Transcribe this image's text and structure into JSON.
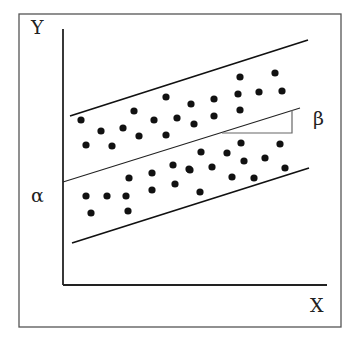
{
  "diagram": {
    "title": "",
    "labels": {
      "y_axis": "Y",
      "x_axis": "X",
      "intercept": "α",
      "slope": "β"
    },
    "frame": {
      "x": 19,
      "y": 14,
      "w": 322,
      "h": 313,
      "color": "#555555"
    },
    "axes": {
      "origin": [
        63,
        285
      ],
      "y_top": 29,
      "x_right": 327,
      "color": "#222222"
    },
    "lines": {
      "upper_bound": {
        "x1": 70,
        "y1": 116,
        "x2": 308,
        "y2": 40
      },
      "regression": {
        "x1": 63,
        "y1": 182,
        "x2": 300,
        "y2": 108
      },
      "lower_bound": {
        "x1": 72,
        "y1": 243,
        "x2": 309,
        "y2": 168
      }
    },
    "slope_triangle": {
      "x1": 222,
      "y": 133,
      "x2": 292,
      "y_top": 110
    },
    "points": [
      [
        81,
        120
      ],
      [
        101,
        131
      ],
      [
        86,
        145
      ],
      [
        112,
        146
      ],
      [
        123,
        128
      ],
      [
        134,
        111
      ],
      [
        139,
        136
      ],
      [
        154,
        120
      ],
      [
        166,
        97
      ],
      [
        166,
        135
      ],
      [
        177,
        118
      ],
      [
        191,
        104
      ],
      [
        194,
        124
      ],
      [
        214,
        99
      ],
      [
        214,
        116
      ],
      [
        240,
        77
      ],
      [
        238,
        94
      ],
      [
        240,
        110
      ],
      [
        259,
        92
      ],
      [
        275,
        73
      ],
      [
        282,
        91
      ],
      [
        86,
        196
      ],
      [
        107,
        196
      ],
      [
        91,
        213
      ],
      [
        126,
        196
      ],
      [
        129,
        178
      ],
      [
        152,
        173
      ],
      [
        128,
        211
      ],
      [
        152,
        190
      ],
      [
        173,
        165
      ],
      [
        175,
        184
      ],
      [
        189,
        169
      ],
      [
        201,
        152
      ],
      [
        227,
        153
      ],
      [
        190,
        170
      ],
      [
        212,
        167
      ],
      [
        241,
        143
      ],
      [
        244,
        161
      ],
      [
        254,
        178
      ],
      [
        265,
        158
      ],
      [
        280,
        144
      ],
      [
        285,
        168
      ],
      [
        232,
        177
      ],
      [
        200,
        192
      ]
    ]
  }
}
